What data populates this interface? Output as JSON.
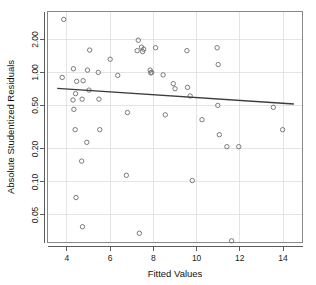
{
  "chart_data": {
    "type": "scatter",
    "title": "",
    "xlabel": "Fitted Values",
    "ylabel": "Absolute Studentized Residuals",
    "xlim": [
      3.1,
      14.9
    ],
    "ylim": [
      0.028,
      3.6
    ],
    "yscale": "log",
    "xscale": "linear",
    "grid": true,
    "legend": null,
    "xticks": [
      4,
      6,
      8,
      10,
      12,
      14
    ],
    "xtick_labels": [
      "4",
      "6",
      "8",
      "10",
      "12",
      "14"
    ],
    "yticks": [
      2.0,
      1.0,
      0.5,
      0.2,
      0.1,
      0.05
    ],
    "ytick_labels": [
      "2.00",
      "1.00",
      "0.50",
      "0.20",
      "0.10",
      "0.05"
    ],
    "points": [
      {
        "x": 3.85,
        "y": 3.05
      },
      {
        "x": 3.78,
        "y": 0.9
      },
      {
        "x": 4.3,
        "y": 1.08
      },
      {
        "x": 4.45,
        "y": 0.83
      },
      {
        "x": 4.28,
        "y": 0.56
      },
      {
        "x": 4.4,
        "y": 0.64
      },
      {
        "x": 4.32,
        "y": 0.46
      },
      {
        "x": 4.38,
        "y": 0.3
      },
      {
        "x": 4.42,
        "y": 0.072
      },
      {
        "x": 4.68,
        "y": 0.155
      },
      {
        "x": 4.72,
        "y": 0.039
      },
      {
        "x": 4.75,
        "y": 0.84
      },
      {
        "x": 4.7,
        "y": 0.57
      },
      {
        "x": 4.95,
        "y": 1.05
      },
      {
        "x": 4.92,
        "y": 0.23
      },
      {
        "x": 5.05,
        "y": 1.6
      },
      {
        "x": 5.02,
        "y": 0.69
      },
      {
        "x": 5.45,
        "y": 1.0
      },
      {
        "x": 5.48,
        "y": 0.57
      },
      {
        "x": 5.52,
        "y": 0.3
      },
      {
        "x": 6.0,
        "y": 1.32
      },
      {
        "x": 6.35,
        "y": 0.94
      },
      {
        "x": 6.75,
        "y": 0.115
      },
      {
        "x": 6.8,
        "y": 0.43
      },
      {
        "x": 7.3,
        "y": 1.97
      },
      {
        "x": 7.25,
        "y": 1.58
      },
      {
        "x": 7.35,
        "y": 0.034
      },
      {
        "x": 7.45,
        "y": 1.7
      },
      {
        "x": 7.5,
        "y": 1.55
      },
      {
        "x": 7.55,
        "y": 1.63
      },
      {
        "x": 7.85,
        "y": 1.05
      },
      {
        "x": 7.88,
        "y": 0.99
      },
      {
        "x": 7.92,
        "y": 1.0
      },
      {
        "x": 8.1,
        "y": 1.68
      },
      {
        "x": 8.45,
        "y": 0.95
      },
      {
        "x": 8.55,
        "y": 0.41
      },
      {
        "x": 8.92,
        "y": 0.79
      },
      {
        "x": 9.0,
        "y": 0.71
      },
      {
        "x": 9.55,
        "y": 1.58
      },
      {
        "x": 9.58,
        "y": 0.73
      },
      {
        "x": 9.7,
        "y": 0.61
      },
      {
        "x": 9.8,
        "y": 0.103
      },
      {
        "x": 10.25,
        "y": 0.37
      },
      {
        "x": 10.95,
        "y": 1.68
      },
      {
        "x": 11.0,
        "y": 1.18
      },
      {
        "x": 10.98,
        "y": 0.5
      },
      {
        "x": 11.05,
        "y": 0.27
      },
      {
        "x": 11.4,
        "y": 0.21
      },
      {
        "x": 11.62,
        "y": 0.029
      },
      {
        "x": 11.95,
        "y": 0.21
      },
      {
        "x": 13.55,
        "y": 0.48
      },
      {
        "x": 13.98,
        "y": 0.3
      }
    ],
    "trend_line": {
      "name": "lowess-smooth",
      "x_start": 3.55,
      "y_start": 0.715,
      "x_end": 14.5,
      "y_end": 0.515
    }
  }
}
